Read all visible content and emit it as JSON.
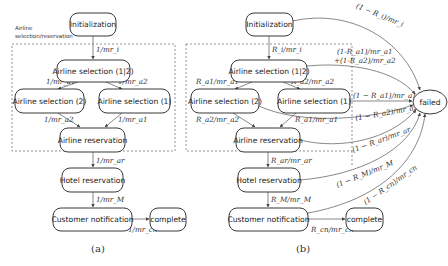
{
  "panel_a": {
    "caption": "(a)",
    "group_label_line1": "Airline",
    "group_label_line2": "selection/reservation",
    "nodes": {
      "init": "Initialization",
      "sel12": "Airline selection (1|2)",
      "sel2": "Airline selection (2)",
      "sel1": "Airline selection (1)",
      "res": "Airline reservation",
      "hotel": "Hotel reservation",
      "notify": "Customer notification",
      "complete": "complete"
    },
    "edges": {
      "init_sel12": "1/mr_i",
      "sel12_sel2": "1/mr_a1",
      "sel12_sel1": "1/mr_a2",
      "sel2_res": "1/mr_a2",
      "sel1_res": "1/mr_a1",
      "res_hotel": "1/mr_ar",
      "hotel_notify": "1/mr_M",
      "notify_complete": "1/mr_cn"
    }
  },
  "panel_b": {
    "caption": "(b)",
    "nodes": {
      "init": "Initialization",
      "sel12": "Airline selection (1|2)",
      "sel2": "Airline selection (2)",
      "sel1": "Airline selection (1)",
      "res": "Airline reservation",
      "hotel": "Hotel reservation",
      "notify": "Customer notification",
      "complete": "complete",
      "failed": "failed"
    },
    "edges": {
      "init_sel12": "R_i/mr_i",
      "sel12_sel2": "R_a1/mr_a1",
      "sel12_sel1": "R_a2/mr_a2",
      "sel2_res": "R_a2/mr_a2",
      "sel1_res": "R_a1/mr_a1",
      "res_hotel": "R_ar/mr_ar",
      "hotel_notify": "R_M/mr_M",
      "notify_complete": "R_cn/mr_cn",
      "init_failed": "(1 − R_i)/mr_i",
      "sel12_failed_line1": "(1-R_a1)/mr_a1",
      "sel12_failed_line2": "+(1-R_a2)/mr_a2",
      "sel1_failed": "(1 − R_a1)/mr_a1",
      "sel2_failed": "(1 − R_a2)/mr_a2",
      "res_failed": "(1 − R_ar)/mr_ar",
      "hotel_failed": "(1 − R_M)/mr_M",
      "notify_failed": "(1 − R_cn)/mr_cn"
    }
  }
}
